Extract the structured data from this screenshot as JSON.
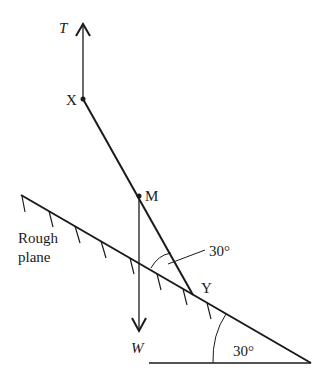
{
  "diagram": {
    "type": "mechanics-force-diagram",
    "colors": {
      "stroke": "#1a1a1a",
      "background": "#ffffff"
    },
    "labels": {
      "tension": "T",
      "weight": "W",
      "point_x": "X",
      "point_m": "M",
      "point_y": "Y",
      "rod_angle": "30°",
      "incline_angle": "30°",
      "plane_line1": "Rough",
      "plane_line2": "plane"
    },
    "points": {
      "X": [
        83,
        99
      ],
      "M": [
        139,
        196
      ],
      "Y": [
        193,
        295
      ],
      "plane_left": [
        21,
        195
      ],
      "plane_right": [
        311,
        363
      ]
    },
    "angles": {
      "rod_to_plane_deg": 30,
      "plane_incline_deg": 30
    }
  }
}
